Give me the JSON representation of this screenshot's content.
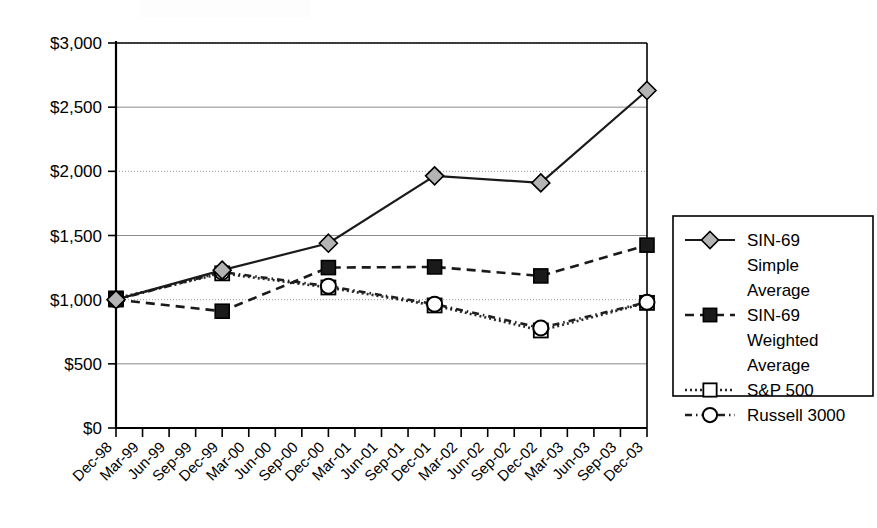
{
  "chart_data": {
    "type": "line",
    "title": "",
    "xlabel": "",
    "ylabel": "",
    "ylim": [
      0,
      3000
    ],
    "ytick_values": [
      0,
      500,
      1000,
      1500,
      2000,
      2500,
      3000
    ],
    "ytick_labels": [
      "$0",
      "$500",
      "$1,000",
      "$1,500",
      "$2,000",
      "$2,500",
      "$3,000"
    ],
    "grid": true,
    "legend_position": "right",
    "categories": [
      "Dec-98",
      "Mar-99",
      "Jun-99",
      "Sep-99",
      "Dec-99",
      "Mar-00",
      "Jun-00",
      "Sep-00",
      "Dec-00",
      "Mar-01",
      "Jun-01",
      "Sep-01",
      "Dec-01",
      "Mar-02",
      "Jun-02",
      "Sep-02",
      "Dec-02",
      "Mar-03",
      "Jun-03",
      "Sep-03",
      "Dec-03"
    ],
    "marker_categories": [
      "Dec-98",
      "Dec-99",
      "Dec-00",
      "Dec-01",
      "Dec-02",
      "Dec-03"
    ],
    "series": [
      {
        "name": "SIN-69 Simple Average",
        "marker": "diamond",
        "marker_fill": "#b4b4b4",
        "line_style": "solid",
        "x": [
          "Dec-98",
          "Dec-99",
          "Dec-00",
          "Dec-01",
          "Dec-02",
          "Dec-03"
        ],
        "values": [
          1000,
          1230,
          1440,
          1965,
          1910,
          2630
        ]
      },
      {
        "name": "SIN-69 Weighted Average",
        "marker": "square-filled",
        "marker_fill": "#1a1a1a",
        "line_style": "dashed",
        "x": [
          "Dec-98",
          "Dec-99",
          "Dec-00",
          "Dec-01",
          "Dec-02",
          "Dec-03"
        ],
        "values": [
          1000,
          910,
          1250,
          1255,
          1185,
          1425
        ]
      },
      {
        "name": "S&P 500",
        "marker": "square-open",
        "marker_fill": "#ffffff",
        "line_style": "dotted",
        "x": [
          "Dec-98",
          "Dec-99",
          "Dec-00",
          "Dec-01",
          "Dec-02",
          "Dec-03"
        ],
        "values": [
          1010,
          1205,
          1095,
          955,
          760,
          975
        ]
      },
      {
        "name": "Russell 3000",
        "marker": "circle-open",
        "marker_fill": "#ffffff",
        "line_style": "dash-dot",
        "x": [
          "Dec-98",
          "Dec-99",
          "Dec-00",
          "Dec-01",
          "Dec-02",
          "Dec-03"
        ],
        "values": [
          1000,
          1215,
          1105,
          965,
          780,
          980
        ]
      }
    ]
  },
  "legend": {
    "entries": [
      {
        "label_lines": [
          "SIN-69",
          "Simple",
          "Average"
        ],
        "marker": "diamond",
        "line_style": "solid"
      },
      {
        "label_lines": [
          "SIN-69",
          "Weighted",
          "Average"
        ],
        "marker": "square-filled",
        "line_style": "dashed"
      },
      {
        "label_lines": [
          "S&P 500"
        ],
        "marker": "square-open",
        "line_style": "dotted"
      },
      {
        "label_lines": [
          "Russell 3000"
        ],
        "marker": "circle-open",
        "line_style": "dash-dot"
      }
    ]
  },
  "colors": {
    "axis": "#000000",
    "grid": "#8a8a8a",
    "background": "#ffffff",
    "diamond_fill": "#b4b4b4",
    "square_fill": "#1a1a1a"
  }
}
